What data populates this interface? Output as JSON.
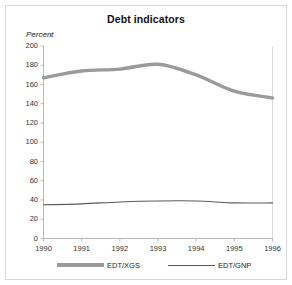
{
  "chart_data": {
    "type": "line",
    "title": "Debt indicators",
    "xlabel": "",
    "ylabel": "Percent",
    "ylim": [
      0,
      200
    ],
    "xlim": [
      1990,
      1996
    ],
    "yticks": [
      0,
      20,
      40,
      60,
      80,
      100,
      120,
      140,
      160,
      180,
      200
    ],
    "xticks": [
      1990,
      1991,
      1992,
      1993,
      1994,
      1995,
      1996
    ],
    "grid": false,
    "legend_position": "bottom",
    "x": [
      1990,
      1991,
      1992,
      1993,
      1994,
      1995,
      1996
    ],
    "series": [
      {
        "name": "EDT/XGS",
        "color": "#9a9a9a",
        "linewidth": "thick",
        "values": [
          167,
          174,
          176,
          181,
          170,
          153,
          146
        ]
      },
      {
        "name": "EDT/GNP",
        "color": "#5a5a5a",
        "linewidth": "thin",
        "values": [
          35,
          36,
          38,
          39,
          39,
          37,
          37
        ]
      }
    ]
  },
  "axis": {
    "unit_label": "Percent",
    "ytick_labels": [
      "200",
      "180",
      "160",
      "140",
      "120",
      "100",
      "80",
      "60",
      "40",
      "20",
      "0"
    ],
    "xtick_labels": [
      "1990",
      "1991",
      "1992",
      "1993",
      "1994",
      "1995",
      "1996"
    ]
  },
  "legend": {
    "entries": [
      {
        "label": "EDT/XGS"
      },
      {
        "label": "EDT/GNP"
      }
    ]
  }
}
